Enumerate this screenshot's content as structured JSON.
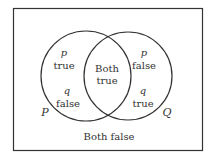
{
  "diagram": {
    "type": "venn",
    "sets": [
      {
        "name": "P",
        "label": "P"
      },
      {
        "name": "Q",
        "label": "Q"
      }
    ],
    "regions": {
      "p_only": {
        "line1": "p",
        "line2": "true",
        "line3": "q",
        "line4": "false"
      },
      "intersection": {
        "line1": "Both",
        "line2": "true"
      },
      "q_only": {
        "line1": "p",
        "line2": "false",
        "line3": "q",
        "line4": "true"
      },
      "outside": {
        "text": "Both false"
      }
    },
    "colors": {
      "stroke": "#333333",
      "background": "#ffffff"
    }
  }
}
